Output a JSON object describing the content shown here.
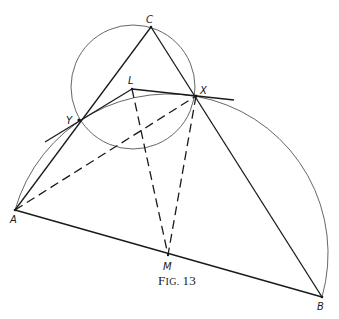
{
  "figure": {
    "caption_prefix": "F",
    "caption_small": "IG.",
    "caption_number": "13",
    "caption_full": "Fig. 13"
  },
  "points": {
    "A": {
      "label": "A",
      "x": 15,
      "y": 210
    },
    "B": {
      "label": "B",
      "x": 322,
      "y": 297
    },
    "C": {
      "label": "C",
      "x": 151,
      "y": 27
    },
    "X": {
      "label": "X",
      "x": 196,
      "y": 96
    },
    "Y": {
      "label": "Y",
      "x": 79,
      "y": 120
    },
    "L": {
      "label": "L",
      "x": 132,
      "y": 89
    },
    "M": {
      "label": "M",
      "x": 168,
      "y": 255
    }
  },
  "circles": {
    "small_circle": {
      "through": [
        "C",
        "X",
        "Y"
      ],
      "cx": 133,
      "cy": 87,
      "r": 62
    },
    "semicircle_AB": {
      "diameter": [
        "A",
        "B"
      ],
      "center": "M",
      "r": 159.5
    }
  },
  "segments": {
    "solid": [
      [
        "A",
        "B"
      ],
      [
        "A",
        "C"
      ],
      [
        "C",
        "B"
      ],
      [
        "L",
        "X"
      ],
      [
        "L",
        "Y"
      ]
    ],
    "dashed": [
      [
        "A",
        "X"
      ],
      [
        "L",
        "M"
      ],
      [
        "X",
        "M"
      ]
    ],
    "tangents": [
      "tangent at Y",
      "tangent at X"
    ]
  },
  "colors": {
    "ink": "#1a1a1a",
    "circle": "#555555",
    "background": "#ffffff"
  }
}
